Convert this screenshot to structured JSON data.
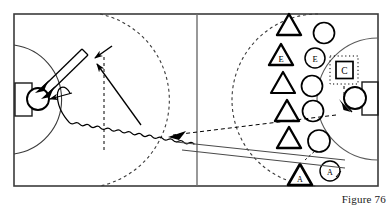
{
  "figure": {
    "caption": "Figure 76",
    "title": "",
    "width": 392,
    "height": 207
  },
  "colors": {
    "ink": "#000000",
    "field_line": "#3b3b3b",
    "thin_line": "#555555",
    "paper": "#ffffff"
  },
  "field": {
    "name": "playing-field",
    "left": 14,
    "top": 14,
    "right": 378,
    "bottom": 186,
    "center_line_x": 197,
    "goals": [
      {
        "side": "left",
        "label": ""
      },
      {
        "side": "right",
        "label": ""
      }
    ]
  },
  "markers": {
    "triangles": [
      {
        "label": "",
        "x": 289,
        "y": 26
      },
      {
        "label": "E",
        "x": 281,
        "y": 56
      },
      {
        "label": "",
        "x": 283,
        "y": 84
      },
      {
        "label": "",
        "x": 287,
        "y": 112
      },
      {
        "label": "",
        "x": 289,
        "y": 139
      },
      {
        "label": "A",
        "x": 300,
        "y": 176
      }
    ],
    "circles": [
      {
        "label": "",
        "x": 324,
        "y": 33
      },
      {
        "label": "E",
        "x": 315,
        "y": 58
      },
      {
        "label": "",
        "x": 312,
        "y": 86
      },
      {
        "label": "",
        "x": 313,
        "y": 111
      },
      {
        "label": "",
        "x": 319,
        "y": 141
      },
      {
        "label": "A",
        "x": 330,
        "y": 171
      }
    ],
    "coach_box": {
      "label": "C",
      "x": 344,
      "y": 70
    },
    "goalkeepers": [
      {
        "name": "left-goalkeeper",
        "x": 38,
        "y": 99
      },
      {
        "name": "right-goalkeeper",
        "x": 355,
        "y": 98
      }
    ]
  },
  "annotations": {
    "shot_label": "",
    "dribble_label": "",
    "pass_label": "",
    "run_label": ""
  },
  "legend_semantics": {
    "triangle": "defender",
    "circle": "attacker",
    "wavy_line": "dribble",
    "double_line": "shot",
    "dashed_line": "run without ball",
    "solid_line": "pass"
  }
}
